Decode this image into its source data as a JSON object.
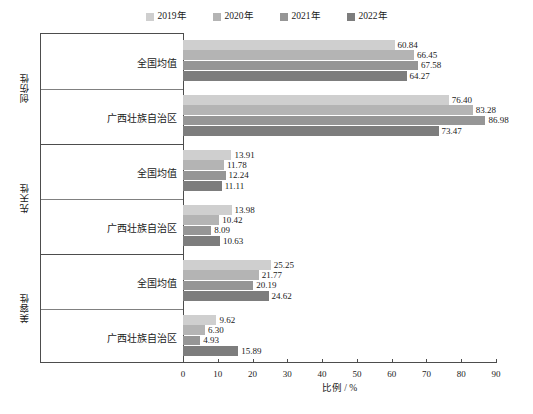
{
  "chart_data": {
    "type": "bar",
    "orientation": "horizontal",
    "title": "",
    "xlabel": "比例 / %",
    "ylabel": "",
    "xlim": [
      0,
      90
    ],
    "xticks": [
      0,
      10,
      20,
      30,
      40,
      50,
      60,
      70,
      80,
      90
    ],
    "grid": false,
    "legend_position": "top-center",
    "series_names": [
      "2019年",
      "2020年",
      "2021年",
      "2022年"
    ],
    "series_colors": [
      "#cfcfcf",
      "#b4b4b4",
      "#969696",
      "#7d7d7d"
    ],
    "panels": [
      {
        "name": "创伤性",
        "categories": [
          "全国均值",
          "广西壮族自治区"
        ],
        "series": [
          {
            "name": "2019年",
            "values": [
              60.84,
              76.4
            ]
          },
          {
            "name": "2020年",
            "values": [
              66.45,
              83.28
            ]
          },
          {
            "name": "2021年",
            "values": [
              67.58,
              86.98
            ]
          },
          {
            "name": "2022年",
            "values": [
              64.27,
              73.47
            ]
          }
        ]
      },
      {
        "name": "先天性",
        "categories": [
          "全国均值",
          "广西壮族自治区"
        ],
        "series": [
          {
            "name": "2019年",
            "values": [
              13.91,
              13.98
            ]
          },
          {
            "name": "2020年",
            "values": [
              11.78,
              10.42
            ]
          },
          {
            "name": "2021年",
            "values": [
              12.24,
              8.09
            ]
          },
          {
            "name": "2022年",
            "values": [
              11.11,
              10.63
            ]
          }
        ]
      },
      {
        "name": "美容性",
        "categories": [
          "全国均值",
          "广西壮族自治区"
        ],
        "series": [
          {
            "name": "2019年",
            "values": [
              25.25,
              9.62
            ]
          },
          {
            "name": "2020年",
            "values": [
              21.77,
              6.3
            ]
          },
          {
            "name": "2021年",
            "values": [
              20.19,
              4.93
            ]
          },
          {
            "name": "2022年",
            "values": [
              24.62,
              15.89
            ]
          }
        ]
      }
    ]
  },
  "legend": {
    "items": [
      {
        "label": "2019年",
        "color": "#cfcfcf"
      },
      {
        "label": "2020年",
        "color": "#b4b4b4"
      },
      {
        "label": "2021年",
        "color": "#969696",
        "swatch_icon": "square-swatch-icon"
      },
      {
        "label": "2022年",
        "color": "#7d7d7d"
      }
    ]
  },
  "axis": {
    "x_title": "比例 / %",
    "x_tick_labels": [
      "0",
      "10",
      "20",
      "30",
      "40",
      "50",
      "60",
      "70",
      "80",
      "90"
    ]
  },
  "caption": {
    "text": ""
  }
}
